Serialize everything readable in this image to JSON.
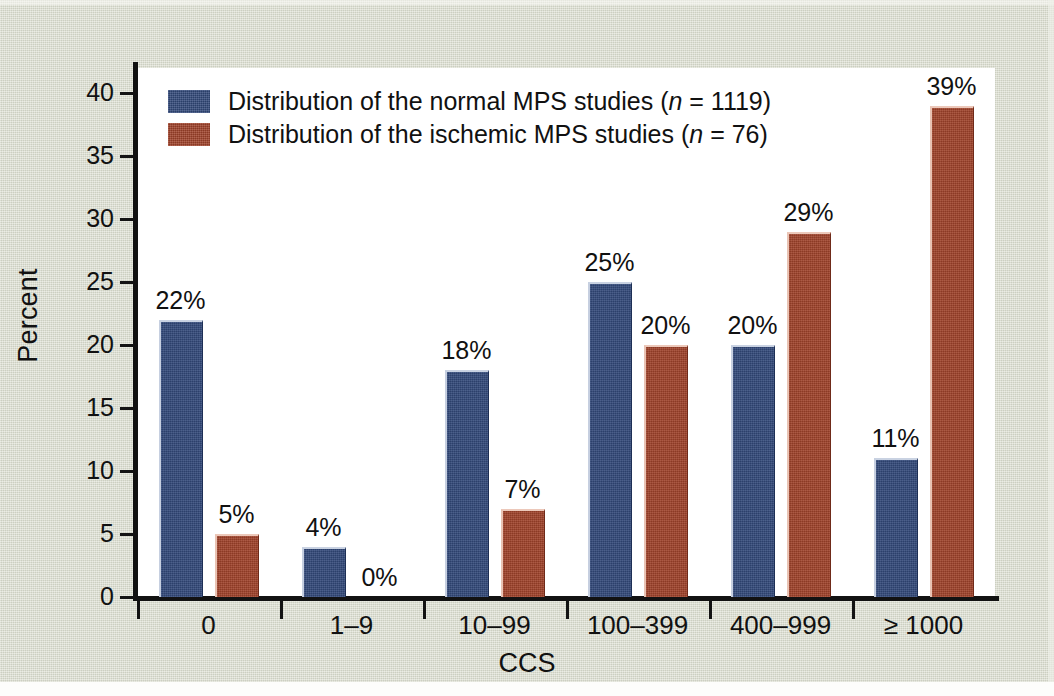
{
  "chart_data": {
    "type": "bar",
    "title": "",
    "xlabel": "CCS",
    "ylabel": "Percent",
    "ylim": [
      0,
      42
    ],
    "yticks": [
      0,
      5,
      10,
      15,
      20,
      25,
      30,
      35,
      40
    ],
    "grid": false,
    "legend_position": "top-left",
    "categories": [
      "0",
      "1–9",
      "10–99",
      "100–399",
      "400–999",
      "≥ 1000"
    ],
    "series": [
      {
        "name": "Distribution of the normal MPS studies (n = 1119)",
        "short_name": "normal MPS studies",
        "n": 1119,
        "color": "#32497a",
        "values": [
          22,
          4,
          18,
          25,
          20,
          11
        ],
        "labels": [
          "22%",
          "4%",
          "18%",
          "25%",
          "20%",
          "11%"
        ]
      },
      {
        "name": "Distribution of the ischemic MPS studies (n = 76)",
        "short_name": "ischemic MPS studies",
        "n": 76,
        "color": "#a0422a",
        "values": [
          5,
          0,
          7,
          20,
          29,
          39
        ],
        "labels": [
          "5%",
          "0%",
          "7%",
          "20%",
          "29%",
          "39%"
        ]
      }
    ]
  },
  "axes": {
    "y_title": "Percent",
    "x_title": "CCS",
    "y_tick_labels": [
      "40",
      "35",
      "30",
      "25",
      "20",
      "15",
      "10",
      "5",
      "0"
    ]
  },
  "legend": {
    "items": [
      {
        "prefix": "Distribution of the normal MPS studies (",
        "italic": "n",
        "suffix": " = 1119)",
        "color": "#32497a",
        "swatch_name": "legend-swatch-normal"
      },
      {
        "prefix": "Distribution of the ischemic MPS studies (",
        "italic": "n",
        "suffix": " = 76)",
        "color": "#a0422a",
        "swatch_name": "legend-swatch-ischemic"
      }
    ]
  },
  "colors": {
    "normal_bar": "#32497a",
    "ischemic_bar": "#a0422a",
    "paper_background": "#d8dbcc",
    "plot_background": "#ffffff",
    "axis": "#121212",
    "text": "#111111"
  }
}
